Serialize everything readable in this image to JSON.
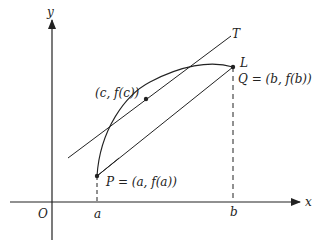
{
  "diagram": {
    "axes": {
      "x_label": "x",
      "y_label": "y",
      "origin_label": "O"
    },
    "ticks": {
      "a": "a",
      "b": "b"
    },
    "points": {
      "P": "P = (a, f(a))",
      "Q": "Q = (b, f(b))",
      "C": "(c, f(c))"
    },
    "line_labels": {
      "tangent": "T",
      "secant": "L"
    },
    "colors": {
      "stroke": "#222222",
      "background": "#ffffff"
    }
  }
}
